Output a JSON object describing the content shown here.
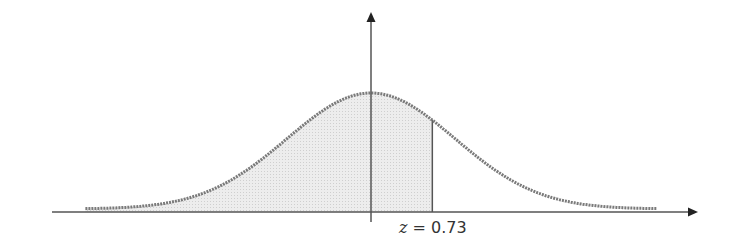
{
  "chart_data": {
    "type": "area",
    "title": "",
    "distribution": "standard normal",
    "mean": 0,
    "sd": 1,
    "shaded_region": {
      "from": "-inf",
      "to": 0.73
    },
    "annotation": {
      "var": "z",
      "eq": " = ",
      "value": "0.73"
    },
    "xlabel": "",
    "ylabel": "",
    "x_range": [
      -3.4,
      3.4
    ],
    "grid": false,
    "legend": false
  },
  "colors": {
    "curve": "#777777",
    "fill": "#e4e4e4",
    "axis": "#444444"
  }
}
